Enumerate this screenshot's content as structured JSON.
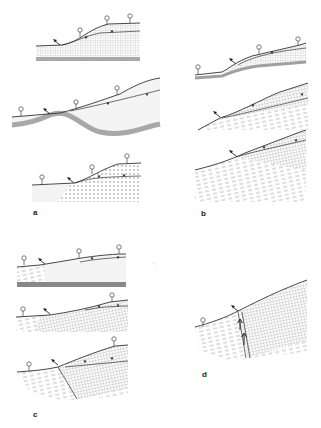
{
  "figure": {
    "panels": [
      {
        "id": "a",
        "label": "a",
        "sections": 3,
        "description": "Cross-sections of unconfined aquifer slopes with springs/wells; fine dotted and stippled deposits over grey bedrock"
      },
      {
        "id": "b",
        "label": "b",
        "sections": 3,
        "description": "Slope cross-sections with dashed (layered) bedrock and grid-hatched cover"
      },
      {
        "id": "c",
        "label": "c",
        "sections": 3,
        "description": "Slope cross-sections with layered bedrock; bottom section shows a fault"
      },
      {
        "id": "d",
        "label": "d",
        "sections": 1,
        "description": "Slope cross-section with vertical dyke/fault zone and upward flow arrows"
      }
    ],
    "symbols": {
      "well": "open circle on stem",
      "water_table": "inverted triangle marker",
      "spring_flow": "arrow pointing up-left"
    },
    "colors": {
      "line": "#333333",
      "bedrock": "#a8a8a8",
      "stipple": "#b8b8b8",
      "background": "#ffffff"
    }
  }
}
